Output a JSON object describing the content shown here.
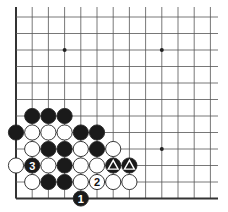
{
  "diagram": {
    "type": "go-board-fragment",
    "visible_columns": 13,
    "visible_rows": 12,
    "edges": [
      "left",
      "bottom"
    ],
    "star_points": [
      [
        3,
        2
      ],
      [
        9,
        2
      ],
      [
        9,
        8
      ]
    ],
    "colors": {
      "line": "#555555",
      "edge": "#333333",
      "black": "#1a1a1a",
      "white": "#ffffff",
      "star": "#222222"
    },
    "stones": [
      {
        "col": 1,
        "row": 6,
        "color": "black",
        "label": ""
      },
      {
        "col": 2,
        "row": 6,
        "color": "black",
        "label": ""
      },
      {
        "col": 3,
        "row": 6,
        "color": "black",
        "label": ""
      },
      {
        "col": 0,
        "row": 7,
        "color": "black",
        "label": ""
      },
      {
        "col": 1,
        "row": 7,
        "color": "white",
        "label": ""
      },
      {
        "col": 2,
        "row": 7,
        "color": "white",
        "label": ""
      },
      {
        "col": 3,
        "row": 7,
        "color": "white",
        "label": ""
      },
      {
        "col": 4,
        "row": 7,
        "color": "black",
        "label": ""
      },
      {
        "col": 5,
        "row": 7,
        "color": "black",
        "label": ""
      },
      {
        "col": 1,
        "row": 8,
        "color": "white",
        "label": ""
      },
      {
        "col": 2,
        "row": 8,
        "color": "black",
        "label": ""
      },
      {
        "col": 3,
        "row": 8,
        "color": "black",
        "label": ""
      },
      {
        "col": 4,
        "row": 8,
        "color": "white",
        "label": ""
      },
      {
        "col": 5,
        "row": 8,
        "color": "black",
        "label": ""
      },
      {
        "col": 6,
        "row": 8,
        "color": "white",
        "label": ""
      },
      {
        "col": 0,
        "row": 9,
        "color": "white",
        "label": ""
      },
      {
        "col": 1,
        "row": 9,
        "color": "black",
        "label": "3"
      },
      {
        "col": 2,
        "row": 9,
        "color": "white",
        "label": ""
      },
      {
        "col": 3,
        "row": 9,
        "color": "black",
        "label": ""
      },
      {
        "col": 4,
        "row": 9,
        "color": "white",
        "label": ""
      },
      {
        "col": 5,
        "row": 9,
        "color": "white",
        "label": ""
      },
      {
        "col": 6,
        "row": 9,
        "color": "black",
        "label": "",
        "mark": "triangle"
      },
      {
        "col": 7,
        "row": 9,
        "color": "black",
        "label": "",
        "mark": "triangle"
      },
      {
        "col": 1,
        "row": 10,
        "color": "white",
        "label": ""
      },
      {
        "col": 2,
        "row": 10,
        "color": "black",
        "label": ""
      },
      {
        "col": 3,
        "row": 10,
        "color": "black",
        "label": ""
      },
      {
        "col": 4,
        "row": 10,
        "color": "white",
        "label": ""
      },
      {
        "col": 5,
        "row": 10,
        "color": "white",
        "label": "2"
      },
      {
        "col": 6,
        "row": 10,
        "color": "white",
        "label": ""
      },
      {
        "col": 7,
        "row": 10,
        "color": "white",
        "label": ""
      },
      {
        "col": 4,
        "row": 11,
        "color": "black",
        "label": "1"
      }
    ]
  }
}
